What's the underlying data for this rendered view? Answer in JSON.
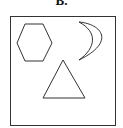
{
  "option_label": "B.",
  "shapes": [
    "hexagon",
    "crescent",
    "triangle"
  ],
  "colors": {
    "stroke": "#333333",
    "background": "#ffffff"
  }
}
